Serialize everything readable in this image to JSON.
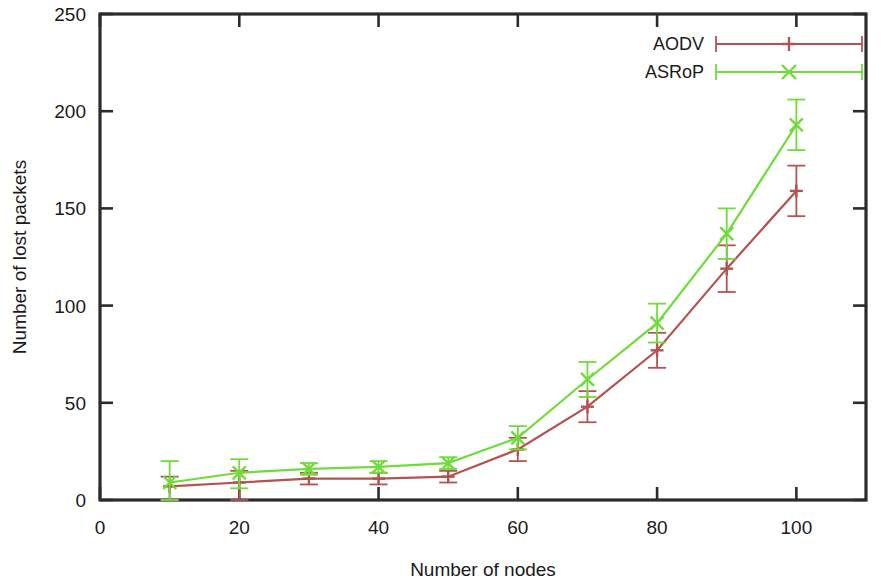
{
  "chart_data": {
    "type": "line",
    "title": "",
    "subtitle": "",
    "xlabel": "Number of nodes",
    "ylabel": "Number of lost packets",
    "xlim": [
      0,
      110
    ],
    "ylim": [
      0,
      250
    ],
    "xticks": [
      0,
      20,
      40,
      60,
      80,
      100
    ],
    "xtick_labels": [
      "0",
      "20",
      "40",
      "60",
      "80",
      "100"
    ],
    "yticks": [
      0,
      50,
      100,
      150,
      200,
      250
    ],
    "ytick_labels": [
      "0",
      "50",
      "100",
      "150",
      "200",
      "250"
    ],
    "grid": false,
    "legend_position": "top-right",
    "x": [
      10,
      20,
      30,
      40,
      50,
      60,
      70,
      80,
      90,
      100
    ],
    "series": [
      {
        "name": "AODV",
        "color": "#b5524f",
        "marker": "plus",
        "values": [
          7,
          9,
          11,
          11,
          12,
          26,
          48,
          77,
          119,
          159
        ],
        "err_low": [
          7,
          9,
          3,
          3,
          3,
          6,
          8,
          9,
          12,
          13
        ],
        "err_high": [
          5,
          6,
          3,
          3,
          3,
          6,
          8,
          9,
          12,
          13
        ]
      },
      {
        "name": "ASRoP",
        "color": "#6fdc3a",
        "marker": "cross",
        "values": [
          9,
          14,
          16,
          17,
          19,
          32,
          62,
          91,
          137,
          193
        ],
        "err_low": [
          9,
          8,
          3,
          3,
          3,
          6,
          9,
          10,
          13,
          13
        ],
        "err_high": [
          11,
          7,
          3,
          3,
          3,
          6,
          9,
          10,
          13,
          13
        ]
      }
    ]
  },
  "legend": {
    "entries": [
      {
        "label": "AODV"
      },
      {
        "label": "ASRoP"
      }
    ]
  }
}
